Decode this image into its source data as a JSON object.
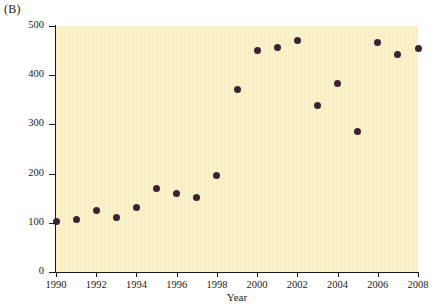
{
  "figure": {
    "panel_label": "(B)",
    "background_color": "#ffffff"
  },
  "chart_data": {
    "type": "scatter",
    "title": "",
    "subtitle": "",
    "xlabel": "Year",
    "ylabel": "Number of journal articles",
    "xlim": [
      1990,
      2008
    ],
    "ylim": [
      0,
      500
    ],
    "xticks": [
      1990,
      1992,
      1994,
      1996,
      1998,
      2000,
      2002,
      2004,
      2006,
      2008
    ],
    "xtick_labels": [
      "1990",
      "1992",
      "1994",
      "1996",
      "1998",
      "2000",
      "2002",
      "2004",
      "2006",
      "2008"
    ],
    "yticks": [
      0,
      100,
      200,
      300,
      400,
      500
    ],
    "ytick_labels": [
      "0",
      "100",
      "200",
      "300",
      "400",
      "500"
    ],
    "grid": false,
    "legend": null,
    "plot_background_color": "#f5edc4",
    "marker_color": "#3d2235",
    "marker_size": 7,
    "x": [
      1990,
      1991,
      1992,
      1993,
      1994,
      1995,
      1996,
      1997,
      1998,
      1999,
      2000,
      2001,
      2002,
      2003,
      2004,
      2005,
      2006,
      2007,
      2008
    ],
    "y": [
      102,
      106,
      125,
      111,
      132,
      169,
      160,
      152,
      196,
      370,
      450,
      456,
      470,
      338,
      384,
      285,
      467,
      443,
      455
    ],
    "points": [
      {
        "year": 1990,
        "value": 102
      },
      {
        "year": 1991,
        "value": 106
      },
      {
        "year": 1992,
        "value": 125
      },
      {
        "year": 1993,
        "value": 111
      },
      {
        "year": 1994,
        "value": 132
      },
      {
        "year": 1995,
        "value": 169
      },
      {
        "year": 1996,
        "value": 160
      },
      {
        "year": 1997,
        "value": 152
      },
      {
        "year": 1998,
        "value": 196
      },
      {
        "year": 1999,
        "value": 370
      },
      {
        "year": 2000,
        "value": 450
      },
      {
        "year": 2001,
        "value": 456
      },
      {
        "year": 2002,
        "value": 470
      },
      {
        "year": 2003,
        "value": 338
      },
      {
        "year": 2004,
        "value": 384
      },
      {
        "year": 2005,
        "value": 285
      },
      {
        "year": 2006,
        "value": 467
      },
      {
        "year": 2007,
        "value": 443
      },
      {
        "year": 2008,
        "value": 455
      }
    ]
  }
}
